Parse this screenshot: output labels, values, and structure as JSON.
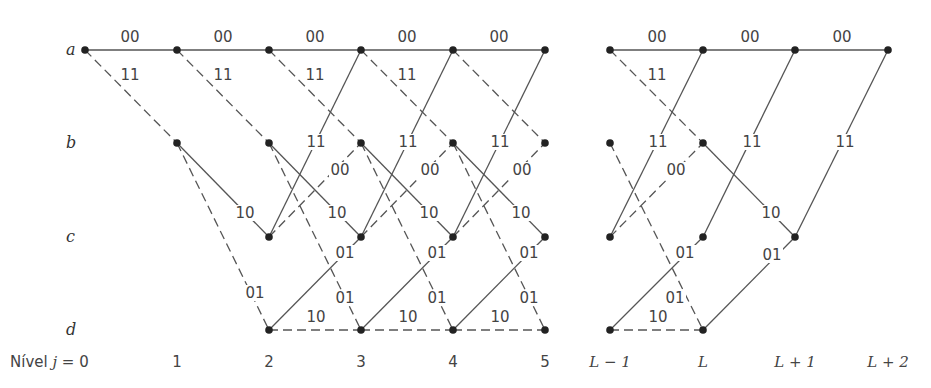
{
  "diagram": {
    "type": "trellis",
    "states": [
      {
        "id": "a",
        "label": "a",
        "y": 50
      },
      {
        "id": "b",
        "label": "b",
        "y": 143
      },
      {
        "id": "c",
        "label": "c",
        "y": 237
      },
      {
        "id": "d",
        "label": "d",
        "y": 330
      }
    ],
    "levels_label": "Nível j = 0",
    "levels": [
      {
        "label": "1",
        "x": 177,
        "italic": false
      },
      {
        "label": "2",
        "x": 269,
        "italic": false
      },
      {
        "label": "3",
        "x": 361,
        "italic": false
      },
      {
        "label": "4",
        "x": 453,
        "italic": false
      },
      {
        "label": "5",
        "x": 545,
        "italic": false
      },
      {
        "label": "L − 1",
        "x": 610,
        "italic": true
      },
      {
        "label": "L",
        "x": 703,
        "italic": true
      },
      {
        "label": "L + 1",
        "x": 795,
        "italic": true
      },
      {
        "label": "L + 2",
        "x": 888,
        "italic": true
      }
    ],
    "level0_x": 85,
    "legend": {
      "solid": "input bit 0",
      "dashed": "input bit 1"
    },
    "nodes": [
      {
        "s": "a",
        "x": 85
      },
      {
        "s": "a",
        "x": 177
      },
      {
        "s": "b",
        "x": 177
      },
      {
        "s": "a",
        "x": 269
      },
      {
        "s": "b",
        "x": 269
      },
      {
        "s": "c",
        "x": 269
      },
      {
        "s": "d",
        "x": 269
      },
      {
        "s": "a",
        "x": 361
      },
      {
        "s": "b",
        "x": 361
      },
      {
        "s": "c",
        "x": 361
      },
      {
        "s": "d",
        "x": 361
      },
      {
        "s": "a",
        "x": 453
      },
      {
        "s": "b",
        "x": 453
      },
      {
        "s": "c",
        "x": 453
      },
      {
        "s": "d",
        "x": 453
      },
      {
        "s": "a",
        "x": 545
      },
      {
        "s": "b",
        "x": 545
      },
      {
        "s": "c",
        "x": 545
      },
      {
        "s": "d",
        "x": 545
      },
      {
        "s": "a",
        "x": 610
      },
      {
        "s": "b",
        "x": 610
      },
      {
        "s": "c",
        "x": 610
      },
      {
        "s": "d",
        "x": 610
      },
      {
        "s": "a",
        "x": 703
      },
      {
        "s": "b",
        "x": 703
      },
      {
        "s": "c",
        "x": 703
      },
      {
        "s": "d",
        "x": 703
      },
      {
        "s": "a",
        "x": 795
      },
      {
        "s": "c",
        "x": 795
      },
      {
        "s": "a",
        "x": 888
      }
    ],
    "edges": [
      {
        "from": [
          "a",
          85
        ],
        "to": [
          "a",
          177
        ],
        "style": "solid",
        "label": "00",
        "lx": 130,
        "ly": 42
      },
      {
        "from": [
          "a",
          85
        ],
        "to": [
          "b",
          177
        ],
        "style": "dashed",
        "label": "11",
        "lx": 130,
        "ly": 80
      },
      {
        "from": [
          "a",
          177
        ],
        "to": [
          "a",
          269
        ],
        "style": "solid",
        "label": "00",
        "lx": 223,
        "ly": 42
      },
      {
        "from": [
          "a",
          177
        ],
        "to": [
          "b",
          269
        ],
        "style": "dashed",
        "label": "11",
        "lx": 223,
        "ly": 80
      },
      {
        "from": [
          "b",
          177
        ],
        "to": [
          "c",
          269
        ],
        "style": "solid",
        "label": "10",
        "lx": 245,
        "ly": 218
      },
      {
        "from": [
          "b",
          177
        ],
        "to": [
          "d",
          269
        ],
        "style": "dashed",
        "label": "01",
        "lx": 255,
        "ly": 298
      },
      {
        "from": [
          "a",
          269
        ],
        "to": [
          "a",
          361
        ],
        "style": "solid",
        "label": "00",
        "lx": 315,
        "ly": 42
      },
      {
        "from": [
          "a",
          269
        ],
        "to": [
          "b",
          361
        ],
        "style": "dashed",
        "label": "11",
        "lx": 315,
        "ly": 80
      },
      {
        "from": [
          "b",
          269
        ],
        "to": [
          "c",
          361
        ],
        "style": "solid",
        "label": "10",
        "lx": 337,
        "ly": 218
      },
      {
        "from": [
          "b",
          269
        ],
        "to": [
          "d",
          361
        ],
        "style": "dashed",
        "label": "01",
        "lx": 345,
        "ly": 303
      },
      {
        "from": [
          "c",
          269
        ],
        "to": [
          "a",
          361
        ],
        "style": "solid",
        "label": "11",
        "lx": 316,
        "ly": 147
      },
      {
        "from": [
          "c",
          269
        ],
        "to": [
          "b",
          361
        ],
        "style": "dashed",
        "label": "00",
        "lx": 340,
        "ly": 175
      },
      {
        "from": [
          "d",
          269
        ],
        "to": [
          "c",
          361
        ],
        "style": "solid",
        "label": "01",
        "lx": 345,
        "ly": 258
      },
      {
        "from": [
          "d",
          269
        ],
        "to": [
          "d",
          361
        ],
        "style": "dashed",
        "label": "10",
        "lx": 316,
        "ly": 322
      },
      {
        "from": [
          "a",
          361
        ],
        "to": [
          "a",
          453
        ],
        "style": "solid",
        "label": "00",
        "lx": 407,
        "ly": 42
      },
      {
        "from": [
          "a",
          361
        ],
        "to": [
          "b",
          453
        ],
        "style": "dashed",
        "label": "11",
        "lx": 407,
        "ly": 80
      },
      {
        "from": [
          "b",
          361
        ],
        "to": [
          "c",
          453
        ],
        "style": "solid",
        "label": "10",
        "lx": 429,
        "ly": 218
      },
      {
        "from": [
          "b",
          361
        ],
        "to": [
          "d",
          453
        ],
        "style": "dashed",
        "label": "01",
        "lx": 437,
        "ly": 303
      },
      {
        "from": [
          "c",
          361
        ],
        "to": [
          "a",
          453
        ],
        "style": "solid",
        "label": "11",
        "lx": 408,
        "ly": 147
      },
      {
        "from": [
          "c",
          361
        ],
        "to": [
          "b",
          453
        ],
        "style": "dashed",
        "label": "00",
        "lx": 430,
        "ly": 175
      },
      {
        "from": [
          "d",
          361
        ],
        "to": [
          "c",
          453
        ],
        "style": "solid",
        "label": "01",
        "lx": 437,
        "ly": 258
      },
      {
        "from": [
          "d",
          361
        ],
        "to": [
          "d",
          453
        ],
        "style": "dashed",
        "label": "10",
        "lx": 408,
        "ly": 322
      },
      {
        "from": [
          "a",
          453
        ],
        "to": [
          "a",
          545
        ],
        "style": "solid",
        "label": "00",
        "lx": 499,
        "ly": 42
      },
      {
        "from": [
          "a",
          453
        ],
        "to": [
          "b",
          545
        ],
        "style": "dashed",
        "label": "",
        "lx": 0,
        "ly": 0
      },
      {
        "from": [
          "b",
          453
        ],
        "to": [
          "c",
          545
        ],
        "style": "solid",
        "label": "10",
        "lx": 521,
        "ly": 218
      },
      {
        "from": [
          "b",
          453
        ],
        "to": [
          "d",
          545
        ],
        "style": "dashed",
        "label": "01",
        "lx": 529,
        "ly": 303
      },
      {
        "from": [
          "c",
          453
        ],
        "to": [
          "a",
          545
        ],
        "style": "solid",
        "label": "11",
        "lx": 500,
        "ly": 147
      },
      {
        "from": [
          "c",
          453
        ],
        "to": [
          "b",
          545
        ],
        "style": "dashed",
        "label": "00",
        "lx": 522,
        "ly": 175
      },
      {
        "from": [
          "d",
          453
        ],
        "to": [
          "c",
          545
        ],
        "style": "solid",
        "label": "01",
        "lx": 529,
        "ly": 258
      },
      {
        "from": [
          "d",
          453
        ],
        "to": [
          "d",
          545
        ],
        "style": "dashed",
        "label": "10",
        "lx": 500,
        "ly": 322
      },
      {
        "from": [
          "a",
          610
        ],
        "to": [
          "a",
          703
        ],
        "style": "solid",
        "label": "00",
        "lx": 657,
        "ly": 42
      },
      {
        "from": [
          "a",
          610
        ],
        "to": [
          "b",
          703
        ],
        "style": "dashed",
        "label": "11",
        "lx": 657,
        "ly": 80
      },
      {
        "from": [
          "b",
          610
        ],
        "to": [
          "d",
          703
        ],
        "style": "dashed",
        "label": "01",
        "lx": 675,
        "ly": 303
      },
      {
        "from": [
          "c",
          610
        ],
        "to": [
          "a",
          703
        ],
        "style": "solid",
        "label": "11",
        "lx": 658,
        "ly": 147
      },
      {
        "from": [
          "c",
          610
        ],
        "to": [
          "b",
          703
        ],
        "style": "dashed",
        "label": "00",
        "lx": 676,
        "ly": 175
      },
      {
        "from": [
          "d",
          610
        ],
        "to": [
          "c",
          703
        ],
        "style": "solid",
        "label": "01",
        "lx": 685,
        "ly": 258
      },
      {
        "from": [
          "d",
          610
        ],
        "to": [
          "d",
          703
        ],
        "style": "dashed",
        "label": "10",
        "lx": 658,
        "ly": 322
      },
      {
        "from": [
          "a",
          703
        ],
        "to": [
          "a",
          795
        ],
        "style": "solid",
        "label": "00",
        "lx": 750,
        "ly": 42
      },
      {
        "from": [
          "b",
          703
        ],
        "to": [
          "c",
          795
        ],
        "style": "solid",
        "label": "10",
        "lx": 771,
        "ly": 218
      },
      {
        "from": [
          "c",
          703
        ],
        "to": [
          "a",
          795
        ],
        "style": "solid",
        "label": "11",
        "lx": 752,
        "ly": 147
      },
      {
        "from": [
          "d",
          703
        ],
        "to": [
          "c",
          795
        ],
        "style": "solid",
        "label": "01",
        "lx": 772,
        "ly": 260
      },
      {
        "from": [
          "a",
          795
        ],
        "to": [
          "a",
          888
        ],
        "style": "solid",
        "label": "00",
        "lx": 842,
        "ly": 42
      },
      {
        "from": [
          "c",
          795
        ],
        "to": [
          "a",
          888
        ],
        "style": "solid",
        "label": "11",
        "lx": 845,
        "ly": 147
      }
    ]
  }
}
